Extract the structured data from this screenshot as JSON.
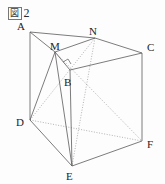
{
  "figure": {
    "caption_kanji": "図",
    "caption_number": "2",
    "caption_full": "図 2",
    "shape": "triangular-prism",
    "stroke_color": "#5a5a5a",
    "label_color": "#1e1e1e",
    "background_color": "#fdfdfd"
  },
  "vertices": [
    {
      "id": "A",
      "label": "A",
      "x": 30,
      "y": 32,
      "label_x": 17,
      "label_y": 30,
      "visible": true
    },
    {
      "id": "B",
      "label": "B",
      "x": 70,
      "y": 70,
      "label_x": 64,
      "label_y": 86,
      "visible": true
    },
    {
      "id": "C",
      "label": "C",
      "x": 142,
      "y": 53,
      "label_x": 147,
      "label_y": 51,
      "visible": true
    },
    {
      "id": "D",
      "label": "D",
      "x": 30,
      "y": 120,
      "label_x": 16,
      "label_y": 126,
      "visible": true
    },
    {
      "id": "E",
      "label": "E",
      "x": 72,
      "y": 166,
      "label_x": 66,
      "label_y": 180,
      "visible": true
    },
    {
      "id": "F",
      "label": "F",
      "x": 142,
      "y": 141,
      "label_x": 147,
      "label_y": 148,
      "visible": true
    },
    {
      "id": "M",
      "label": "M",
      "x": 55,
      "y": 52,
      "label_x": 50,
      "label_y": 50,
      "visible": true
    },
    {
      "id": "N",
      "label": "N",
      "x": 95,
      "y": 38,
      "label_x": 89,
      "label_y": 35,
      "visible": true
    }
  ],
  "edges": [
    {
      "id": "A-M",
      "from": "A",
      "to": "M",
      "style": "solid"
    },
    {
      "id": "M-B",
      "from": "M",
      "to": "B",
      "style": "solid"
    },
    {
      "id": "A-N",
      "from": "A",
      "to": "N",
      "style": "solid"
    },
    {
      "id": "N-C",
      "from": "N",
      "to": "C",
      "style": "solid"
    },
    {
      "id": "M-N",
      "from": "M",
      "to": "N",
      "style": "solid"
    },
    {
      "id": "B-C",
      "from": "B",
      "to": "C",
      "style": "solid"
    },
    {
      "id": "A-D",
      "from": "A",
      "to": "D",
      "style": "solid"
    },
    {
      "id": "B-E",
      "from": "B",
      "to": "E",
      "style": "solid"
    },
    {
      "id": "C-F",
      "from": "C",
      "to": "F",
      "style": "solid"
    },
    {
      "id": "D-E",
      "from": "D",
      "to": "E",
      "style": "solid"
    },
    {
      "id": "E-F",
      "from": "E",
      "to": "F",
      "style": "solid"
    },
    {
      "id": "D-F",
      "from": "D",
      "to": "F",
      "style": "dotted"
    },
    {
      "id": "N-E",
      "from": "N",
      "to": "E",
      "style": "dotted"
    },
    {
      "id": "M-D",
      "from": "M",
      "to": "D",
      "style": "solid"
    },
    {
      "id": "M-E",
      "from": "M",
      "to": "E",
      "style": "solid"
    },
    {
      "id": "D-N",
      "from": "D",
      "to": "N",
      "style": "dotted"
    },
    {
      "id": "M-F",
      "from": "M",
      "to": "F",
      "style": "dotted"
    }
  ],
  "markers": [
    {
      "id": "right-angle-at-B",
      "type": "right-angle",
      "x": 70,
      "y": 70,
      "label": "right angle mark at B"
    }
  ]
}
